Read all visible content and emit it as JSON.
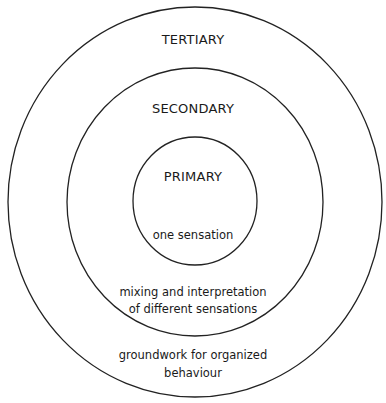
{
  "diagram": {
    "type": "concentric-circles",
    "stroke_color": "#222222",
    "rings": [
      {
        "id": "tertiary",
        "title": "TERTIARY",
        "description_lines": [
          "groundwork for organized",
          "behaviour"
        ]
      },
      {
        "id": "secondary",
        "title": "SECONDARY",
        "description_lines": [
          "mixing and interpretation",
          "of different sensations"
        ]
      },
      {
        "id": "primary",
        "title": "PRIMARY",
        "description_lines": [
          "one sensation"
        ]
      }
    ]
  }
}
